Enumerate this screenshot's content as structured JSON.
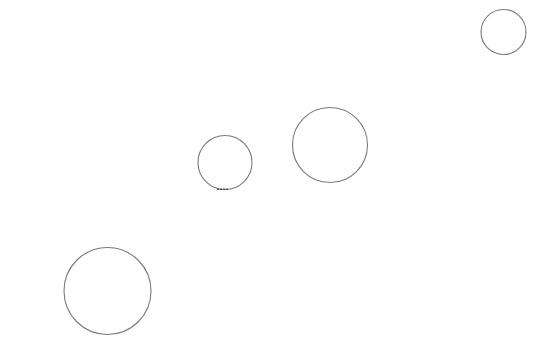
{
  "canvas": {
    "width": 538,
    "height": 355,
    "background": "#ffffff",
    "stroke_color": "#7a7a7a",
    "accent_stroke_color": "#555555",
    "shapes": [
      {
        "type": "circle",
        "name": "circle-top-right",
        "cx": 503.5,
        "cy": 32,
        "r": 22.5
      },
      {
        "type": "circle",
        "name": "circle-small-middle",
        "cx": 225,
        "cy": 162.5,
        "r": 27
      },
      {
        "type": "circle",
        "name": "circle-medium-middle",
        "cx": 330,
        "cy": 145,
        "r": 37.5
      },
      {
        "type": "circle",
        "name": "circle-large-bottom-left",
        "cx": 107.5,
        "cy": 291,
        "r": 43.5
      }
    ],
    "marks": [
      {
        "type": "dash",
        "name": "dash-under-small-circle",
        "x1": 217,
        "y1": 189.3,
        "x2": 229,
        "y2": 189.3
      }
    ]
  }
}
